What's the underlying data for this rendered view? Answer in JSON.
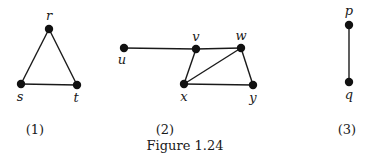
{
  "figure": {
    "caption": "Figure 1.24",
    "graphs": [
      {
        "label": "(1)",
        "vertices": [
          {
            "id": "r",
            "label": "r",
            "x": 49,
            "y": 29,
            "lx": 49,
            "ly": 20
          },
          {
            "id": "s",
            "label": "s",
            "x": 21,
            "y": 84,
            "lx": 20,
            "ly": 101
          },
          {
            "id": "t",
            "label": "t",
            "x": 77,
            "y": 85,
            "lx": 76,
            "ly": 102
          }
        ],
        "edges": [
          [
            "r",
            "s"
          ],
          [
            "r",
            "t"
          ],
          [
            "s",
            "t"
          ]
        ]
      },
      {
        "label": "(2)",
        "vertices": [
          {
            "id": "u",
            "label": "u",
            "x": 124,
            "y": 48,
            "lx": 122,
            "ly": 64
          },
          {
            "id": "v",
            "label": "v",
            "x": 196,
            "y": 49,
            "lx": 196,
            "ly": 41
          },
          {
            "id": "w",
            "label": "w",
            "x": 241,
            "y": 48,
            "lx": 241,
            "ly": 40
          },
          {
            "id": "x",
            "label": "x",
            "x": 184,
            "y": 84,
            "lx": 184,
            "ly": 101
          },
          {
            "id": "y",
            "label": "y",
            "x": 253,
            "y": 85,
            "lx": 253,
            "ly": 102
          }
        ],
        "edges": [
          [
            "u",
            "v"
          ],
          [
            "v",
            "w"
          ],
          [
            "v",
            "x"
          ],
          [
            "x",
            "w"
          ],
          [
            "x",
            "y"
          ],
          [
            "w",
            "y"
          ]
        ]
      },
      {
        "label": "(3)",
        "vertices": [
          {
            "id": "p",
            "label": "p",
            "x": 349,
            "y": 25,
            "lx": 349,
            "ly": 15
          },
          {
            "id": "q",
            "label": "q",
            "x": 349,
            "y": 82,
            "lx": 349,
            "ly": 99
          }
        ],
        "edges": [
          [
            "p",
            "q"
          ]
        ]
      }
    ],
    "subfigure_labels": [
      {
        "text": "(1)",
        "x": 35,
        "y": 134
      },
      {
        "text": "(2)",
        "x": 165,
        "y": 134
      },
      {
        "text": "(3)",
        "x": 347,
        "y": 134
      }
    ],
    "caption_pos": {
      "x": 185,
      "y": 150
    }
  }
}
